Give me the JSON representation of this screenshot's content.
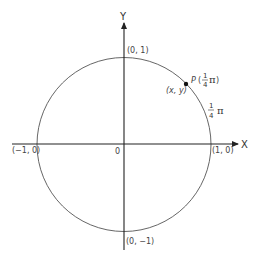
{
  "diagram": {
    "type": "unit-circle",
    "axes": {
      "x_label": "X",
      "y_label": "Y",
      "origin_label": "0"
    },
    "intercepts": {
      "top": "(0, 1)",
      "bottom": "(0, −1)",
      "left": "(−1, 0)",
      "right": "(1, 0)"
    },
    "point": {
      "name": "P",
      "coords_label": "(x, y)",
      "angle_open": "(",
      "angle_close": ")",
      "angle_numerator": "1",
      "angle_denominator": "4",
      "angle_symbol": "π"
    },
    "arc_label": {
      "numerator": "1",
      "denominator": "4",
      "symbol": "π"
    },
    "colors": {
      "axis": "#222222",
      "circle": "#555555",
      "text": "#444444",
      "point": "#111111"
    }
  }
}
